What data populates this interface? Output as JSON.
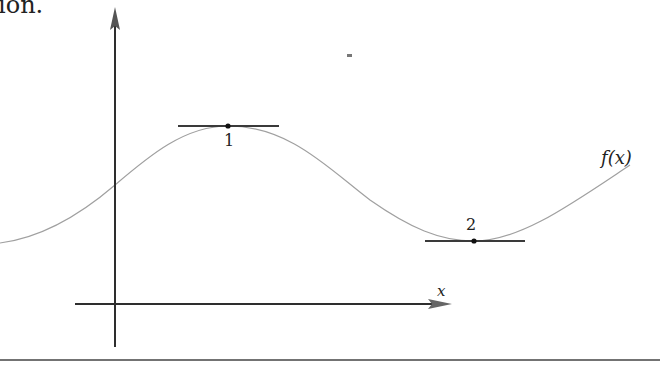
{
  "page": {
    "top_text_fragment": "ion."
  },
  "diagram": {
    "type": "function-graph-with-horizontal-tangents",
    "curve_label": "f(x)",
    "x_axis_label": "x",
    "points": [
      {
        "id": "1",
        "label": "1",
        "kind": "local maximum",
        "tangent": "horizontal"
      },
      {
        "id": "2",
        "label": "2",
        "kind": "local minimum",
        "tangent": "horizontal"
      }
    ],
    "colors": {
      "axis": "#333333",
      "curve": "#9a9a9a",
      "tangent": "#3a3a3a",
      "rule": "#444444"
    }
  }
}
